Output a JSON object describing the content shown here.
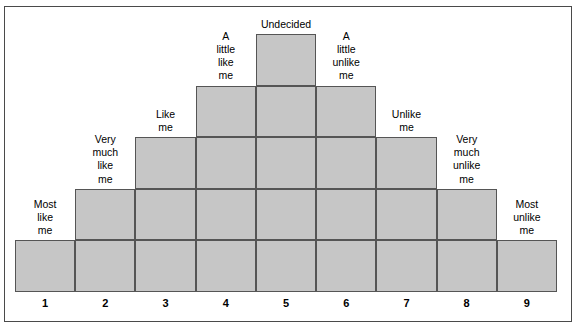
{
  "figure": {
    "type": "forced-choice-q-sort-distribution",
    "title": "",
    "fill_color": "#c6c6c6",
    "border_color": "#555555",
    "frame_color": "#4a4a4a",
    "background_color": "#ffffff"
  },
  "chart_data": {
    "type": "bar",
    "title": "",
    "xlabel": "",
    "ylabel": "",
    "grid": false,
    "legend": false,
    "categories": [
      "1",
      "2",
      "3",
      "4",
      "5",
      "6",
      "7",
      "8",
      "9"
    ],
    "values": [
      1,
      2,
      3,
      4,
      5,
      4,
      3,
      2,
      1
    ],
    "ylim": [
      0,
      5
    ],
    "annotations": [
      "Most\nlike\nme",
      "Very\nmuch\nlike\nme",
      "Like\nme",
      "A\nlittle\nlike\nme",
      "Undecided",
      "A\nlittle\nunlike\nme",
      "Unlike\nme",
      "Very\nmuch\nunlike\nme",
      "Most\nunlike\nme"
    ]
  },
  "columns": [
    {
      "number": "1",
      "height": 1,
      "label": "Most\nlike\nme"
    },
    {
      "number": "2",
      "height": 2,
      "label": "Very\nmuch\nlike\nme"
    },
    {
      "number": "3",
      "height": 3,
      "label": "Like\nme"
    },
    {
      "number": "4",
      "height": 4,
      "label": "A\nlittle\nlike\nme"
    },
    {
      "number": "5",
      "height": 5,
      "label": "Undecided"
    },
    {
      "number": "6",
      "height": 4,
      "label": "A\nlittle\nunlike\nme"
    },
    {
      "number": "7",
      "height": 3,
      "label": "Unlike\nme"
    },
    {
      "number": "8",
      "height": 2,
      "label": "Very\nmuch\nunlike\nme"
    },
    {
      "number": "9",
      "height": 1,
      "label": "Most\nunlike\nme"
    }
  ]
}
